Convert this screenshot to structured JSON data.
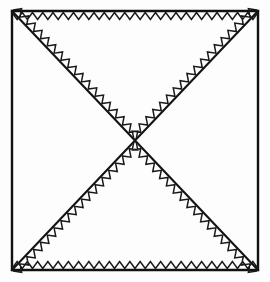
{
  "figure": {
    "background_color": "#fdfdfd",
    "line_color": "#111111",
    "zigzag_color": "#1a1a1a"
  },
  "chart_data": {
    "type": "scatter",
    "xlabel": "",
    "ylabel": "",
    "xlim": [
      0,
      270
    ],
    "ylim": [
      0,
      282
    ],
    "grid": false,
    "legend_position": "none",
    "square": {
      "left": 12,
      "top": 11,
      "right": 258,
      "bottom": 270,
      "width": 246,
      "height": 259,
      "stroke_width": 2.4
    },
    "center": {
      "x": 135,
      "y": 140.5
    },
    "diagonals": [
      {
        "name": "descending-diagonal",
        "from": {
          "x": 12,
          "y": 11
        },
        "to": {
          "x": 258,
          "y": 270
        },
        "stroke_width": 2.1
      },
      {
        "name": "ascending-diagonal",
        "from": {
          "x": 258,
          "y": 11
        },
        "to": {
          "x": 12,
          "y": 270
        },
        "stroke_width": 2.1
      }
    ],
    "zigzag": {
      "amplitude": 7,
      "period": 10.2,
      "stroke_width": 1.5,
      "inset": 1.5,
      "teeth_top_edge": 24,
      "teeth_bottom_edge": 24
    },
    "hatched_triangles": [
      {
        "name": "top-triangle",
        "vertices": [
          {
            "x": 12,
            "y": 11
          },
          {
            "x": 258,
            "y": 11
          },
          {
            "x": 135,
            "y": 140.5
          }
        ],
        "hatched": true
      },
      {
        "name": "bottom-triangle",
        "vertices": [
          {
            "x": 12,
            "y": 270
          },
          {
            "x": 258,
            "y": 270
          },
          {
            "x": 135,
            "y": 140.5
          }
        ],
        "hatched": true
      },
      {
        "name": "left-triangle",
        "vertices": [
          {
            "x": 12,
            "y": 11
          },
          {
            "x": 12,
            "y": 270
          },
          {
            "x": 135,
            "y": 140.5
          }
        ],
        "hatched": false
      },
      {
        "name": "right-triangle",
        "vertices": [
          {
            "x": 258,
            "y": 11
          },
          {
            "x": 258,
            "y": 270
          },
          {
            "x": 135,
            "y": 140.5
          }
        ],
        "hatched": false
      }
    ]
  }
}
